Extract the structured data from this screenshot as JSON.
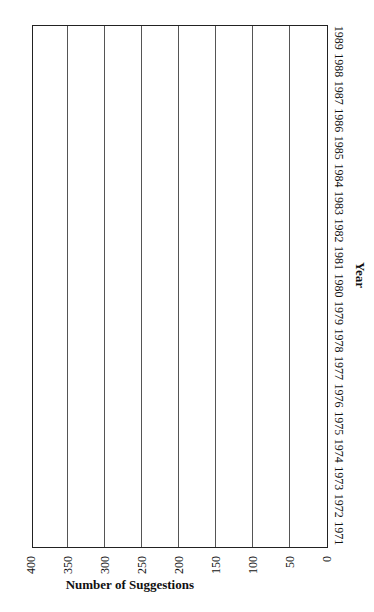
{
  "chart_data": {
    "type": "bar",
    "orientation": "rotated 90deg clockwise (vertical bars rendered sideways)",
    "title": "",
    "xlabel": "Year",
    "ylabel": "Number of Suggestions",
    "ylim": [
      0,
      400
    ],
    "yticks": [
      0,
      50,
      100,
      150,
      200,
      250,
      300,
      350,
      400
    ],
    "grid": true,
    "categories": [
      "1971",
      "1972",
      "1973",
      "1974",
      "1975",
      "1976",
      "1977",
      "1978",
      "1979",
      "1980",
      "1981",
      "1982",
      "1983",
      "1984",
      "1985",
      "1986",
      "1987",
      "1988",
      "1989"
    ],
    "values": [
      231,
      200,
      161,
      151,
      140,
      230,
      170,
      130,
      140,
      145,
      123,
      139,
      200,
      238,
      268,
      169,
      357,
      297,
      218
    ],
    "style": {
      "bar_fill": "#ffffff",
      "bar_shadow": "#111111",
      "border": "#222222"
    }
  }
}
